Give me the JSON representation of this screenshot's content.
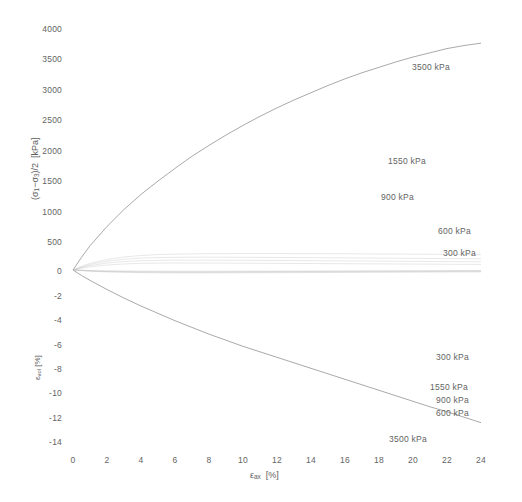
{
  "chart_data": {
    "type": "line",
    "title": "",
    "subtitle": "",
    "xlabel": "εax [%]",
    "xlabel_parts": {
      "symbol": "ε",
      "subscript": "ax",
      "units": "[%]"
    },
    "grid": false,
    "legend_position": "inline-annotations",
    "panels": [
      {
        "name": "deviator-stress-panel",
        "ylabel": "(σ1−σ3)/2  [kPa]",
        "ylabel_parts": {
          "prefix": "(σ",
          "sub1": "1",
          "mid": "−σ",
          "sub2": "3",
          "suffix": ")/2",
          "units": "[kPa]"
        },
        "xlim": [
          0,
          24
        ],
        "ylim": [
          0,
          4000
        ],
        "xticks": [
          0,
          2,
          4,
          6,
          8,
          10,
          12,
          14,
          16,
          18,
          20,
          22,
          24
        ],
        "yticks": [
          0,
          500,
          1000,
          1500,
          2000,
          2500,
          3000,
          3500,
          4000
        ],
        "series": [
          {
            "name": "3500 kPa",
            "label": "3500 kPa",
            "x": [
              0,
              0.5,
              1,
              2,
              3,
              4,
              5,
              6,
              7,
              8,
              9,
              10,
              11,
              12,
              13,
              14,
              15,
              16,
              17,
              18,
              19,
              20,
              21,
              22,
              23,
              24
            ],
            "y": [
              0,
              210,
              400,
              720,
              1000,
              1250,
              1470,
              1680,
              1880,
              2060,
              2230,
              2390,
              2540,
              2680,
              2810,
              2930,
              3050,
              3160,
              3260,
              3350,
              3440,
              3520,
              3590,
              3660,
              3710,
              3750
            ]
          },
          {
            "name": "1550 kPa",
            "label": "1550 kPa",
            "x": [
              0,
              0.5,
              1,
              2,
              3,
              4,
              5,
              6,
              8,
              10,
              12,
              14,
              16,
              18,
              20,
              22,
              24
            ],
            "y": [
              0,
              60,
              110,
              175,
              215,
              240,
              255,
              262,
              270,
              272,
              272,
              270,
              268,
              265,
              262,
              258,
              255
            ]
          },
          {
            "name": "900 kPa",
            "label": "900 kPa",
            "x": [
              0,
              0.5,
              1,
              2,
              3,
              4,
              5,
              6,
              8,
              10,
              12,
              14,
              16,
              18,
              20,
              22,
              24
            ],
            "y": [
              0,
              50,
              92,
              145,
              178,
              196,
              206,
              210,
              212,
              210,
              207,
              204,
              200,
              196,
              192,
              188,
              185
            ]
          },
          {
            "name": "600 kPa",
            "label": "600 kPa",
            "x": [
              0,
              0.5,
              1,
              2,
              3,
              4,
              5,
              6,
              8,
              10,
              12,
              14,
              16,
              18,
              20,
              22,
              24
            ],
            "y": [
              0,
              40,
              72,
              115,
              140,
              153,
              160,
              162,
              162,
              160,
              157,
              154,
              150,
              147,
              143,
              140,
              137
            ]
          },
          {
            "name": "300 kPa",
            "label": "300 kPa",
            "x": [
              0,
              0.5,
              1,
              2,
              3,
              4,
              5,
              6,
              8,
              10,
              12,
              14,
              16,
              18,
              20,
              22,
              24
            ],
            "y": [
              0,
              28,
              52,
              82,
              100,
              110,
              114,
              116,
              115,
              113,
              110,
              107,
              104,
              101,
              98,
              95,
              92
            ]
          }
        ],
        "annotations": [
          {
            "text": "3500 kPa",
            "x": 19.4,
            "y": 3420
          },
          {
            "text": "1550 kPa",
            "x": 17.6,
            "y": 1660
          },
          {
            "text": "900 kPa",
            "x": 18.2,
            "y": 1180
          },
          {
            "text": "600 kPa",
            "x": 20.4,
            "y": 640
          },
          {
            "text": "300 kPa",
            "x": 20.8,
            "y": 330
          }
        ]
      },
      {
        "name": "volumetric-strain-panel",
        "ylabel": "εvol [%]",
        "ylabel_parts": {
          "symbol": "ε",
          "subscript": "vol",
          "units": "[%]"
        },
        "xlim": [
          0,
          24
        ],
        "ylim": [
          -14,
          0
        ],
        "xticks": [
          0,
          2,
          4,
          6,
          8,
          10,
          12,
          14,
          16,
          18,
          20,
          22,
          24
        ],
        "yticks": [
          0,
          -2,
          -4,
          -6,
          -8,
          -10,
          -12,
          -14
        ],
        "series": [
          {
            "name": "3500 kPa",
            "label": "3500 kPa",
            "x": [
              0,
              0.5,
              1,
              2,
              3,
              4,
              5,
              6,
              7,
              8,
              9,
              10,
              11,
              12,
              13,
              14,
              15,
              16,
              17,
              18,
              19,
              20,
              21,
              22,
              23,
              24
            ],
            "y": [
              0,
              -0.45,
              -0.85,
              -1.6,
              -2.3,
              -2.95,
              -3.55,
              -4.15,
              -4.7,
              -5.25,
              -5.75,
              -6.25,
              -6.7,
              -7.15,
              -7.6,
              -8.05,
              -8.5,
              -8.95,
              -9.4,
              -9.85,
              -10.3,
              -10.75,
              -11.2,
              -11.6,
              -12.05,
              -12.5
            ]
          },
          {
            "name": "1550 kPa",
            "label": "1550 kPa",
            "x": [
              0,
              1,
              2,
              4,
              6,
              8,
              10,
              12,
              14,
              16,
              18,
              20,
              22,
              24
            ],
            "y": [
              0,
              -0.1,
              -0.16,
              -0.22,
              -0.24,
              -0.24,
              -0.23,
              -0.22,
              -0.21,
              -0.2,
              -0.19,
              -0.18,
              -0.17,
              -0.16
            ]
          },
          {
            "name": "900 kPa",
            "label": "900 kPa",
            "x": [
              0,
              1,
              2,
              4,
              6,
              8,
              10,
              12,
              14,
              16,
              18,
              20,
              22,
              24
            ],
            "y": [
              0,
              -0.08,
              -0.13,
              -0.18,
              -0.19,
              -0.19,
              -0.18,
              -0.17,
              -0.16,
              -0.15,
              -0.14,
              -0.13,
              -0.12,
              -0.11
            ]
          },
          {
            "name": "600 kPa",
            "label": "600 kPa",
            "x": [
              0,
              1,
              2,
              4,
              6,
              8,
              10,
              12,
              14,
              16,
              18,
              20,
              22,
              24
            ],
            "y": [
              0,
              -0.06,
              -0.1,
              -0.14,
              -0.15,
              -0.15,
              -0.14,
              -0.13,
              -0.12,
              -0.11,
              -0.1,
              -0.09,
              -0.08,
              -0.07
            ]
          },
          {
            "name": "300 kPa",
            "label": "300 kPa",
            "x": [
              0,
              1,
              2,
              4,
              6,
              8,
              10,
              12,
              14,
              16,
              18,
              20,
              22,
              24
            ],
            "y": [
              0,
              -0.04,
              -0.07,
              -0.09,
              -0.1,
              -0.1,
              -0.09,
              -0.09,
              -0.08,
              -0.07,
              -0.06,
              -0.06,
              -0.05,
              -0.05
            ]
          }
        ],
        "annotations": [
          {
            "text": "300 kPa",
            "x": 20.6,
            "y": -7.0
          },
          {
            "text": "1550 kPa",
            "x": 20.2,
            "y": -9.35
          },
          {
            "text": "900 kPa",
            "x": 20.6,
            "y": -10.3
          },
          {
            "text": "600 kPa",
            "x": 20.6,
            "y": -11.3
          },
          {
            "text": "3500 kPa",
            "x": 17.8,
            "y": -13.2
          }
        ]
      }
    ],
    "colors": {
      "background": "#ffffff",
      "curve": "#b9b9b9",
      "curve_strong": "#9a9a9a",
      "text": "#646464"
    }
  }
}
